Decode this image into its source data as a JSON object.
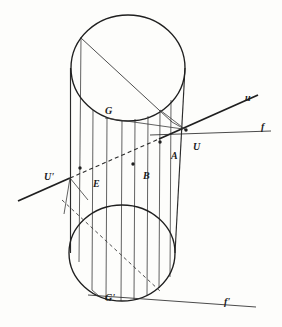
{
  "figure": {
    "stroke_color": "#2b2b2b",
    "background_color": "#fdfdfb",
    "labels": [
      {
        "id": "u",
        "text": "u",
        "x": 245,
        "y": 93,
        "size": "normal"
      },
      {
        "id": "f",
        "text": "f",
        "x": 261,
        "y": 122,
        "size": "normal"
      },
      {
        "id": "U",
        "text": "U",
        "x": 193,
        "y": 142,
        "size": "normal"
      },
      {
        "id": "A",
        "text": "A",
        "x": 171,
        "y": 151,
        "size": "normal"
      },
      {
        "id": "B",
        "text": "B",
        "x": 143,
        "y": 171,
        "size": "normal"
      },
      {
        "id": "E",
        "text": "E",
        "x": 93,
        "y": 179,
        "size": "normal"
      },
      {
        "id": "Uprime",
        "text": "U'",
        "x": 44,
        "y": 172,
        "size": "normal"
      },
      {
        "id": "G",
        "text": "G",
        "x": 105,
        "y": 106,
        "size": "normal"
      },
      {
        "id": "Gprime",
        "text": "G'",
        "x": 105,
        "y": 293,
        "size": "normal"
      },
      {
        "id": "fprime",
        "text": "f'",
        "x": 224,
        "y": 297,
        "size": "normal"
      }
    ],
    "points": [
      {
        "id": "A",
        "x": 160,
        "y": 142
      },
      {
        "id": "B",
        "x": 133,
        "y": 164
      },
      {
        "id": "E",
        "x": 80,
        "y": 168
      },
      {
        "id": "U",
        "x": 185,
        "y": 130
      }
    ],
    "top_circle": {
      "cx": 128,
      "cy": 68,
      "rx": 57,
      "ry": 53
    },
    "bottom_circle": {
      "cx": 122,
      "cy": 253,
      "rx": 53,
      "ry": 48
    },
    "generators_x": [
      70,
      81,
      93,
      107,
      122,
      135,
      148,
      160,
      171,
      183
    ],
    "line_u": {
      "x1": 40,
      "y1": 191,
      "x2": 258,
      "y2": 94
    },
    "line_f": {
      "x1": 163,
      "y1": 136,
      "x2": 271,
      "y2": 131
    },
    "line_fprime": {
      "x1": 97,
      "y1": 296,
      "x2": 256,
      "y2": 306
    },
    "chord_top": {
      "x1": 81,
      "y1": 38,
      "x2": 172,
      "y2": 122
    },
    "chord_bottom": {
      "x1": 62,
      "y1": 200,
      "x2": 160,
      "y2": 291
    }
  }
}
